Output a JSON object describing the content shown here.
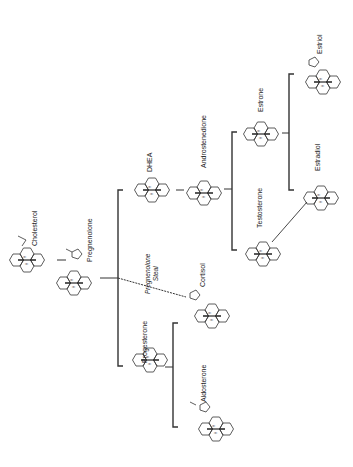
{
  "diagram": {
    "orientation": "rotated -90deg",
    "colors": {
      "line": "#333333",
      "background": "#ffffff",
      "text": "#222222"
    },
    "nodes": {
      "cholesterol": {
        "label": "Cholesterol"
      },
      "pregnenolone": {
        "label": "Pregnenolone"
      },
      "dhea": {
        "label": "DHEA"
      },
      "progesterone": {
        "label": "Progesterone"
      },
      "androstenedione": {
        "label": "Androstenedione"
      },
      "cortisol": {
        "label": "Cortisol"
      },
      "aldosterone": {
        "label": "Aldosterone"
      },
      "testosterone": {
        "label": "Testosterone"
      },
      "estrone": {
        "label": "Estrone"
      },
      "estradiol": {
        "label": "Estradiol"
      },
      "estriol": {
        "label": "Estriol"
      }
    },
    "annotations": {
      "steal_line1": "Pregnenolone",
      "steal_line2": "Steal"
    },
    "edges": [
      {
        "from": "Cholesterol",
        "to": "Pregnenolone",
        "style": "solid"
      },
      {
        "from": "Pregnenolone",
        "to": "DHEA",
        "style": "bracket"
      },
      {
        "from": "Pregnenolone",
        "to": "Progesterone",
        "style": "bracket"
      },
      {
        "from": "Pregnenolone",
        "to": "Cortisol",
        "style": "dashed",
        "label": "Pregnenolone Steal"
      },
      {
        "from": "DHEA",
        "to": "Androstenedione",
        "style": "solid"
      },
      {
        "from": "Progesterone",
        "to": "Cortisol",
        "style": "bracket"
      },
      {
        "from": "Progesterone",
        "to": "Aldosterone",
        "style": "bracket"
      },
      {
        "from": "Androstenedione",
        "to": "Estrone",
        "style": "bracket"
      },
      {
        "from": "Androstenedione",
        "to": "Testosterone",
        "style": "bracket"
      },
      {
        "from": "Estrone",
        "to": "Estriol",
        "style": "bracket"
      },
      {
        "from": "Estrone",
        "to": "Estradiol",
        "style": "bracket"
      },
      {
        "from": "Testosterone",
        "to": "Estradiol",
        "style": "solid"
      }
    ]
  }
}
